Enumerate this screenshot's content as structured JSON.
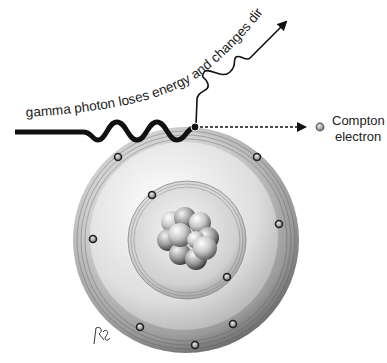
{
  "diagram": {
    "labels": {
      "photon_caption": "gamma photon loses energy and changes direction",
      "electron_line1": "Compton",
      "electron_line2": "electron",
      "signature": "ℛ"
    },
    "atom": {
      "center": [
        186,
        240
      ],
      "outer_radius": 113,
      "inner_radius": 59,
      "outer_shell_electrons": 7,
      "inner_shell_electrons": 2,
      "nucleons": 10
    },
    "colors": {
      "line": "#111111",
      "shell_dark": "#6e6e6e",
      "shell_light": "#e6e6e6",
      "electron": "#a8a8a8"
    }
  }
}
